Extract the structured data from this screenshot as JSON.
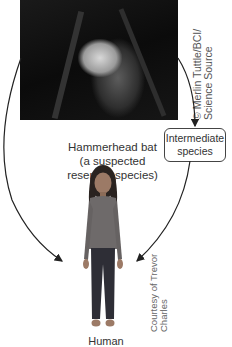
{
  "bat": {
    "image": "hammerhead-bat-photo",
    "label": "Hammerhead bat\n(a suspected\nreservoir species)",
    "credit": "© Merlin Tuttle/BCI/\nScience Source"
  },
  "intermediate": {
    "label": "Intermediate species"
  },
  "human": {
    "image": "human-girl-photo",
    "label": "Human",
    "credit": "Courtesy of Trevor\nCharles"
  },
  "arrows": [
    {
      "from": "bat",
      "to": "human",
      "style": "curved-left"
    },
    {
      "from": "bat",
      "to": "intermediate",
      "style": "curved-right"
    },
    {
      "from": "intermediate",
      "to": "human",
      "style": "curved"
    }
  ],
  "colors": {
    "arrow": "#222222",
    "box_border": "#444444",
    "text": "#333333"
  }
}
